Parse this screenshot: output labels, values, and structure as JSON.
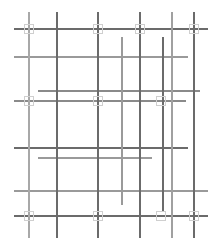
{
  "figure": {
    "width": 222,
    "height": 245,
    "background_color": "#ffffff"
  },
  "style": {
    "line_color_dark": "#5a5a5a",
    "line_color_mid": "#7e7e7e",
    "line_color_light": "#a8a8a8",
    "line_color_pale": "#c4c4c4",
    "marker_stroke_color": "#cfcfcf",
    "marker_fill_color": "none",
    "line_width_thin": 1,
    "line_width_thick": 1.6,
    "marker_size": 9
  },
  "chart_data": {
    "type": "diagram",
    "xlabel": "",
    "ylabel": "",
    "xlim": [
      0,
      222
    ],
    "ylim": [
      0,
      245
    ],
    "grid": false,
    "legend": "none",
    "vertical_lines": [
      {
        "id": "v1",
        "x": 29,
        "y1": 12,
        "y2": 238,
        "color": "#a8a8a8",
        "width": 1.4
      },
      {
        "id": "v2",
        "x": 57,
        "y1": 12,
        "y2": 238,
        "color": "#6b6b6b",
        "width": 1.1
      },
      {
        "id": "v3",
        "x": 98,
        "y1": 12,
        "y2": 238,
        "color": "#6b6b6b",
        "width": 1.1
      },
      {
        "id": "v4",
        "x": 122,
        "y1": 37,
        "y2": 205,
        "color": "#9a9a9a",
        "width": 1.1
      },
      {
        "id": "v5",
        "x": 140,
        "y1": 12,
        "y2": 238,
        "color": "#6b6b6b",
        "width": 1.1
      },
      {
        "id": "v6",
        "x": 163,
        "y1": 37,
        "y2": 211,
        "color": "#6b6b6b",
        "width": 1.1
      },
      {
        "id": "v7",
        "x": 172,
        "y1": 12,
        "y2": 238,
        "color": "#a0a0a0",
        "width": 1.3
      },
      {
        "id": "v8",
        "x": 194,
        "y1": 12,
        "y2": 238,
        "color": "#6b6b6b",
        "width": 1.1
      }
    ],
    "horizontal_lines": [
      {
        "id": "h1",
        "y": 29,
        "x1": 14,
        "x2": 208,
        "color": "#6b6b6b",
        "width": 1.1
      },
      {
        "id": "h2",
        "y": 57,
        "x1": 14,
        "x2": 188,
        "color": "#9a9a9a",
        "width": 1.4
      },
      {
        "id": "h3",
        "y": 91,
        "x1": 38,
        "x2": 200,
        "color": "#8a8a8a",
        "width": 1.5
      },
      {
        "id": "h4",
        "y": 101,
        "x1": 14,
        "x2": 186,
        "color": "#8a8a8a",
        "width": 1.2
      },
      {
        "id": "h5",
        "y": 148,
        "x1": 14,
        "x2": 188,
        "color": "#6b6b6b",
        "width": 1.1
      },
      {
        "id": "h6",
        "y": 158,
        "x1": 38,
        "x2": 152,
        "color": "#9a9a9a",
        "width": 1.3
      },
      {
        "id": "h7",
        "y": 191,
        "x1": 14,
        "x2": 208,
        "color": "#9a9a9a",
        "width": 1.3
      },
      {
        "id": "h8",
        "y": 216,
        "x1": 14,
        "x2": 208,
        "color": "#6b6b6b",
        "width": 1.1
      }
    ],
    "intersection_markers": [
      {
        "id": "m1",
        "x": 29,
        "y": 29
      },
      {
        "id": "m2",
        "x": 98,
        "y": 29
      },
      {
        "id": "m3",
        "x": 140,
        "y": 29
      },
      {
        "id": "m4",
        "x": 194,
        "y": 29
      },
      {
        "id": "m5",
        "x": 29,
        "y": 101
      },
      {
        "id": "m6",
        "x": 98,
        "y": 101
      },
      {
        "id": "m7",
        "x": 161,
        "y": 101
      },
      {
        "id": "m8",
        "x": 29,
        "y": 216
      },
      {
        "id": "m9",
        "x": 98,
        "y": 216
      },
      {
        "id": "m10",
        "x": 161,
        "y": 216
      },
      {
        "id": "m11",
        "x": 194,
        "y": 216
      }
    ]
  }
}
